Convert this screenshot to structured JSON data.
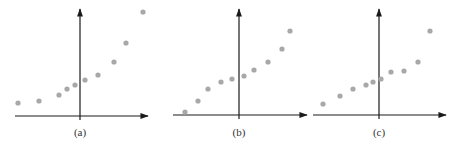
{
  "chart_data": [
    {
      "type": "scatter",
      "label": "(a)",
      "title": "",
      "xlabel": "",
      "ylabel": "",
      "grid": false,
      "axes": {
        "origin_px": [
          80,
          116
        ],
        "x_from": 15,
        "x_to": 148,
        "y_top": 9
      },
      "point_color": "#a8a8a8",
      "points_px": [
        [
          18,
          103
        ],
        [
          39,
          101
        ],
        [
          59,
          95
        ],
        [
          67,
          89
        ],
        [
          75,
          85
        ],
        [
          85,
          80
        ],
        [
          98,
          75
        ],
        [
          114,
          62
        ],
        [
          126,
          43
        ],
        [
          143,
          12
        ]
      ],
      "points": [
        [
          -62,
          13
        ],
        [
          -41,
          15
        ],
        [
          -21,
          21
        ],
        [
          -13,
          27
        ],
        [
          -5,
          31
        ],
        [
          5,
          36
        ],
        [
          18,
          41
        ],
        [
          34,
          54
        ],
        [
          46,
          73
        ],
        [
          63,
          104
        ]
      ]
    },
    {
      "type": "scatter",
      "label": "(b)",
      "title": "",
      "xlabel": "",
      "ylabel": "",
      "grid": false,
      "axes": {
        "origin_px": [
          239,
          115
        ],
        "x_from": 173,
        "x_to": 307,
        "y_top": 9
      },
      "point_color": "#a8a8a8",
      "points_px": [
        [
          185,
          112
        ],
        [
          198,
          101
        ],
        [
          208,
          89
        ],
        [
          221,
          82
        ],
        [
          232,
          79
        ],
        [
          244,
          76
        ],
        [
          254,
          70
        ],
        [
          268,
          62
        ],
        [
          282,
          49
        ],
        [
          290,
          31
        ]
      ],
      "points": [
        [
          -54,
          3
        ],
        [
          -41,
          14
        ],
        [
          -31,
          26
        ],
        [
          -18,
          33
        ],
        [
          -7,
          36
        ],
        [
          5,
          39
        ],
        [
          15,
          45
        ],
        [
          29,
          53
        ],
        [
          43,
          66
        ],
        [
          51,
          84
        ]
      ]
    },
    {
      "type": "scatter",
      "label": "(c)",
      "title": "",
      "xlabel": "",
      "ylabel": "",
      "grid": false,
      "axes": {
        "origin_px": [
          379,
          115
        ],
        "x_from": 313,
        "x_to": 446,
        "y_top": 9
      },
      "point_color": "#a8a8a8",
      "points_px": [
        [
          323,
          104
        ],
        [
          340,
          96
        ],
        [
          353,
          89
        ],
        [
          366,
          85
        ],
        [
          373,
          82
        ],
        [
          381,
          79
        ],
        [
          391,
          72
        ],
        [
          404,
          71
        ],
        [
          418,
          62
        ],
        [
          430,
          31
        ]
      ],
      "points": [
        [
          -56,
          11
        ],
        [
          -39,
          19
        ],
        [
          -26,
          26
        ],
        [
          -13,
          30
        ],
        [
          -6,
          33
        ],
        [
          2,
          36
        ],
        [
          12,
          43
        ],
        [
          25,
          44
        ],
        [
          39,
          53
        ],
        [
          51,
          84
        ]
      ]
    }
  ],
  "style": {
    "axis_color": "#1a1a1a",
    "point_radius": 2.6
  }
}
